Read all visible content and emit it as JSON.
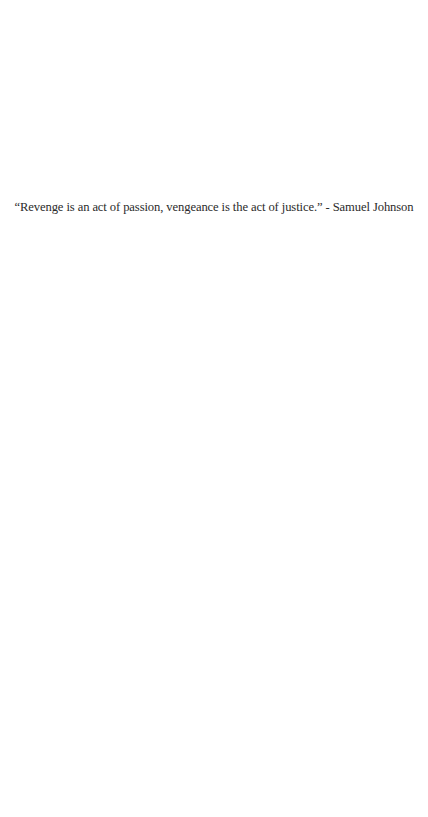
{
  "quote": {
    "text": "“Revenge is an act of passion, vengeance is the act of justice.” - Samuel Johnson",
    "author": "Samuel Johnson"
  },
  "colors": {
    "background": "#ffffff",
    "text": "#2b2b2b"
  }
}
